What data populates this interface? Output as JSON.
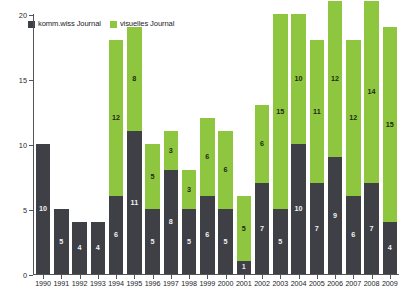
{
  "legend": {
    "entries": [
      {
        "label": "komm.wiss Journal",
        "color": "#3f3f46",
        "icon": "square-swatch-dark"
      },
      {
        "label": "visuelles Journal",
        "color": "#8ec63f",
        "icon": "square-swatch-green"
      }
    ]
  },
  "axes": {
    "y_ticks": [
      "0",
      "5",
      "10",
      "15",
      "20"
    ],
    "x_ticks": [
      "1990",
      "1991",
      "1992",
      "1993",
      "1994",
      "1995",
      "1996",
      "1997",
      "1998",
      "1999",
      "2000",
      "2001",
      "2002",
      "2003",
      "2004",
      "2005",
      "2006",
      "2007",
      "2008",
      "2009"
    ]
  },
  "chart_data": {
    "type": "bar",
    "title": "",
    "subtitle": "",
    "xlabel": "",
    "ylabel": "",
    "stacked": true,
    "grid": false,
    "legend_position": "top-left",
    "ylim": [
      0,
      20
    ],
    "ytick_values": [
      0,
      5,
      10,
      15,
      20
    ],
    "categories": [
      "1990",
      "1991",
      "1992",
      "1993",
      "1994",
      "1995",
      "1996",
      "1997",
      "1998",
      "1999",
      "2000",
      "2001",
      "2002",
      "2003",
      "2004",
      "2005",
      "2006",
      "2007",
      "2008",
      "2009"
    ],
    "series": [
      {
        "name": "komm.wiss Journal",
        "color": "#3f3f46",
        "values": [
          10,
          5,
          4,
          4,
          6,
          11,
          5,
          8,
          5,
          6,
          5,
          1,
          7,
          5,
          10,
          7,
          9,
          6,
          7,
          4
        ]
      },
      {
        "name": "visuelles Journal",
        "color": "#8ec63f",
        "values": [
          0,
          0,
          0,
          0,
          12,
          8,
          5,
          3,
          3,
          6,
          6,
          5,
          6,
          15,
          10,
          11,
          12,
          12,
          14,
          15
        ]
      }
    ],
    "totals": [
      10,
      5,
      4,
      4,
      18,
      19,
      10,
      11,
      8,
      12,
      11,
      6,
      13,
      20,
      20,
      18,
      21,
      18,
      21,
      19
    ]
  }
}
